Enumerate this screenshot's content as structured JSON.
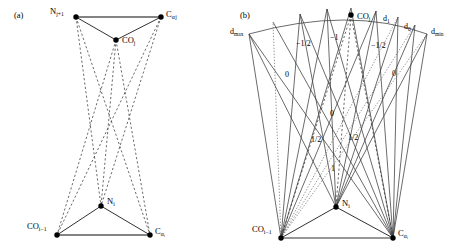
{
  "figure": {
    "panels": [
      {
        "tag": "(a)",
        "tag_pos": [
          14,
          14
        ],
        "type": "double-triangle-hbond-geometry",
        "nodes": [
          {
            "name": "N_j+1",
            "label_html": "N<sub>j+1</sub>",
            "label_text": "Nj+1",
            "x": 76,
            "y": 17,
            "lx": 50,
            "ly": 9,
            "anchor": "left"
          },
          {
            "name": "C_alpha_j",
            "label_html": "C<sub>α j</sub>",
            "label_text": "Cαj",
            "x": 161,
            "y": 17,
            "lx": 166,
            "ly": 12,
            "anchor": "left"
          },
          {
            "name": "CO_j",
            "label_html": "CO<sub>j</sub>",
            "label_text": "COj",
            "x": 116,
            "y": 40,
            "lx": 122,
            "ly": 37,
            "anchor": "left"
          },
          {
            "name": "CO_i-1",
            "label_html": "CO<sub>i−1</sub>",
            "label_text": "COi-1",
            "x": 57,
            "y": 235,
            "lx": 28,
            "ly": 223,
            "anchor": "left"
          },
          {
            "name": "N_i",
            "label_html": "N<sub>i</sub>",
            "label_text": "Ni",
            "x": 101,
            "y": 206,
            "lx": 107,
            "ly": 199,
            "anchor": "left"
          },
          {
            "name": "C_alpha_i",
            "label_html": "C<sub>α i</sub>",
            "label_text": "Cαi",
            "x": 150,
            "y": 235,
            "lx": 155,
            "ly": 228,
            "anchor": "left"
          }
        ],
        "solid_edges": [
          [
            "N_j+1",
            "C_alpha_j"
          ],
          [
            "N_j+1",
            "CO_j"
          ],
          [
            "C_alpha_j",
            "CO_j"
          ],
          [
            "CO_i-1",
            "C_alpha_i"
          ],
          [
            "CO_i-1",
            "N_i"
          ],
          [
            "C_alpha_i",
            "N_i"
          ]
        ],
        "dashed_edges": [
          [
            "N_j+1",
            "N_i"
          ],
          [
            "N_j+1",
            "C_alpha_i"
          ],
          [
            "C_alpha_j",
            "N_i"
          ],
          [
            "C_alpha_j",
            "CO_i-1"
          ],
          [
            "CO_j",
            "CO_i-1"
          ],
          [
            "CO_j",
            "N_i"
          ],
          [
            "CO_j",
            "C_alpha_i"
          ]
        ]
      },
      {
        "tag": "(b)",
        "tag_pos": [
          240,
          14
        ],
        "type": "fan-sector-isocontour",
        "nodes": [
          {
            "name": "CO_j",
            "label_html": "CO<sub>j</sub>",
            "label_text": "COj",
            "x": 351,
            "y": 15,
            "lx": 357,
            "ly": 14,
            "anchor": "left"
          },
          {
            "name": "CO_i-1",
            "label_html": "CO<sub>i−1</sub>",
            "label_text": "COi-1",
            "x": 281,
            "y": 238,
            "lx": 253,
            "ly": 226,
            "anchor": "left"
          },
          {
            "name": "N_i",
            "label_html": "N<sub>i</sub>",
            "label_text": "Ni",
            "x": 336,
            "y": 207,
            "lx": 342,
            "ly": 201,
            "anchor": "left"
          },
          {
            "name": "C_alpha_i",
            "label_html": "C<sub>α i</sub>",
            "label_text": "Cαi",
            "x": 393,
            "y": 238,
            "lx": 398,
            "ly": 231,
            "anchor": "left"
          }
        ],
        "solid_edges": [
          [
            "CO_i-1",
            "C_alpha_i"
          ],
          [
            "CO_i-1",
            "N_i"
          ],
          [
            "C_alpha_i",
            "N_i"
          ]
        ],
        "axis_labels": [
          {
            "name": "d-max-label",
            "html": "d<sub>max</sub>",
            "text": "dmax",
            "x": 231,
            "y": 29
          },
          {
            "name": "d-1-label",
            "html": "d<sub>1</sub>",
            "text": "d1",
            "x": 383,
            "y": 16
          },
          {
            "name": "d-0-label",
            "html": "d<sub>0</sub>",
            "text": "d0",
            "x": 404,
            "y": 24
          },
          {
            "name": "d-min-label",
            "html": "d<sub>min</sub>",
            "text": "dmin",
            "x": 432,
            "y": 29
          }
        ],
        "value_labels": [
          {
            "name": "value-label-neg-half-left",
            "text": "−1/2",
            "x": 296,
            "y": 44
          },
          {
            "name": "value-label-neg-one",
            "text": "−1",
            "x": 329,
            "y": 38
          },
          {
            "name": "value-label-neg-half-right",
            "text": "−1/2",
            "x": 372,
            "y": 46
          },
          {
            "name": "value-label-zero-left",
            "text": "0",
            "x": 285,
            "y": 75
          },
          {
            "name": "value-label-zero-right",
            "text": "0",
            "x": 392,
            "y": 74
          },
          {
            "name": "value-label-zero-center",
            "text": "0",
            "x": 330,
            "y": 114
          },
          {
            "name": "value-label-half-left",
            "text": "1/2",
            "x": 313,
            "y": 140
          },
          {
            "name": "value-label-half-right",
            "text": "1/2",
            "x": 349,
            "y": 138
          },
          {
            "name": "value-label-one",
            "text": "1",
            "x": 330,
            "y": 169
          }
        ]
      }
    ]
  }
}
